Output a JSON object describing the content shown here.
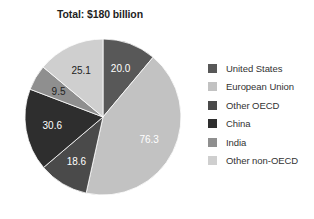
{
  "chart_data": {
    "type": "pie",
    "title": "Total: $180 billion",
    "xlabel": "",
    "ylabel": "",
    "legend_position": "right",
    "grid": false,
    "total": 180.1,
    "start_angle_deg": 0,
    "direction": "clockwise",
    "categories": [
      "United States",
      "European Union",
      "Other OECD",
      "China",
      "India",
      "Other non-OECD"
    ],
    "values": [
      20.0,
      76.3,
      18.6,
      30.6,
      9.5,
      25.1
    ],
    "labels": [
      "20.0",
      "76.3",
      "18.6",
      "30.6",
      "9.5",
      "25.1"
    ],
    "colors": [
      "#585858",
      "#c2c2c2",
      "#4a4a4a",
      "#2e2e2e",
      "#8f8f8f",
      "#cfcfcf"
    ],
    "label_colors": [
      "#ffffff",
      "#ffffff",
      "#ffffff",
      "#ffffff",
      "#222222",
      "#222222"
    ],
    "slices": [
      {
        "name": "United States",
        "value": 20.0,
        "label": "20.0",
        "color": "#585858",
        "label_color": "#ffffff"
      },
      {
        "name": "European Union",
        "value": 76.3,
        "label": "76.3",
        "color": "#c2c2c2",
        "label_color": "#ffffff"
      },
      {
        "name": "Other OECD",
        "value": 18.6,
        "label": "18.6",
        "color": "#4a4a4a",
        "label_color": "#ffffff"
      },
      {
        "name": "China",
        "value": 30.6,
        "label": "30.6",
        "color": "#2e2e2e",
        "label_color": "#ffffff"
      },
      {
        "name": "India",
        "value": 9.5,
        "label": "9.5",
        "color": "#8f8f8f",
        "label_color": "#222222"
      },
      {
        "name": "Other non-OECD",
        "value": 25.1,
        "label": "25.1",
        "color": "#cfcfcf",
        "label_color": "#222222"
      }
    ]
  },
  "legend": {
    "items": [
      {
        "label": "United States",
        "color": "#585858"
      },
      {
        "label": "European Union",
        "color": "#c2c2c2"
      },
      {
        "label": "Other OECD",
        "color": "#4a4a4a"
      },
      {
        "label": "China",
        "color": "#2e2e2e"
      },
      {
        "label": "India",
        "color": "#8f8f8f"
      },
      {
        "label": "Other non-OECD",
        "color": "#cfcfcf"
      }
    ]
  }
}
